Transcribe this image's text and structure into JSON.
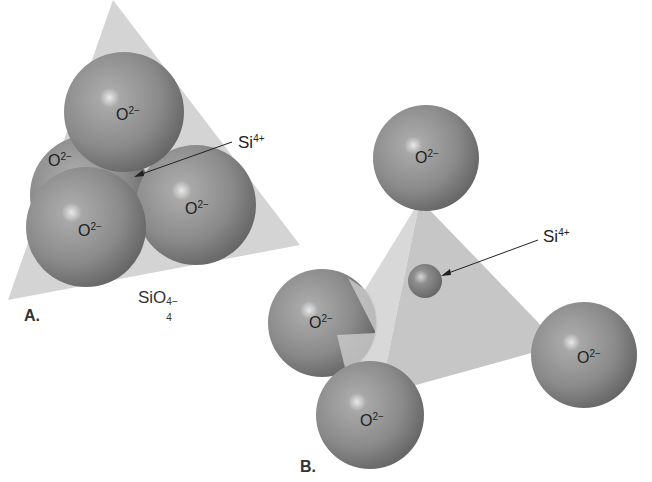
{
  "figure": {
    "panel_a": {
      "label": "A.",
      "formula": {
        "base": "SiO",
        "subscript": "4",
        "superscript": "4−"
      },
      "central_ion": {
        "symbol": "Si",
        "charge": "4+"
      },
      "oxygen_ions": [
        {
          "symbol": "O",
          "charge": "2−",
          "position": "top"
        },
        {
          "symbol": "O",
          "charge": "2−",
          "position": "back-left"
        },
        {
          "symbol": "O",
          "charge": "2−",
          "position": "front-left"
        },
        {
          "symbol": "O",
          "charge": "2−",
          "position": "right"
        }
      ]
    },
    "panel_b": {
      "label": "B.",
      "central_ion": {
        "symbol": "Si",
        "charge": "4+"
      },
      "oxygen_ions": [
        {
          "symbol": "O",
          "charge": "2−",
          "position": "top"
        },
        {
          "symbol": "O",
          "charge": "2−",
          "position": "left"
        },
        {
          "symbol": "O",
          "charge": "2−",
          "position": "bottom"
        },
        {
          "symbol": "O",
          "charge": "2−",
          "position": "right"
        }
      ]
    },
    "colors": {
      "sphere": "#8a8a8a",
      "sphere_highlight": "#e6e6e6",
      "sphere_shadow": "#5a5a5a",
      "tetrahedron_face": "#cfcfcf",
      "tetrahedron_face_dark": "#bdbdbd",
      "background": "#ffffff"
    }
  }
}
